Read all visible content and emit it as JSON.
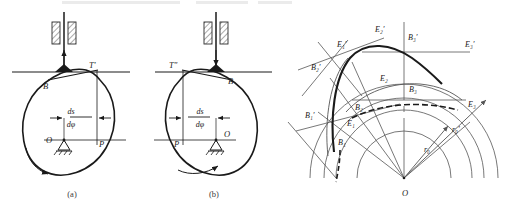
{
  "figure": {
    "background_color": "#ffffff",
    "ink_color": "#1a1a1a",
    "construction_line_color": "#6e6e6e",
    "panels": [
      {
        "id": "a",
        "caption": "(a)",
        "follower_tip_label": "T'",
        "contact_label": "B",
        "center_label": "O",
        "pitch_label": "P",
        "dimension_numerator": "ds",
        "dimension_denominator": "dφ",
        "rotation": "counterclockwise"
      },
      {
        "id": "b",
        "caption": "(b)",
        "follower_tip_label": "T″",
        "contact_label": "B",
        "center_label": "O",
        "pitch_label": "P",
        "dimension_numerator": "ds",
        "dimension_denominator": "dφ",
        "rotation": "clockwise"
      }
    ],
    "panel_c": {
      "center_label": "O",
      "base_radius_label": "r₀",
      "base_radius_prime_label": "r₀′",
      "points": [
        {
          "label": "B₁",
          "x": 338,
          "y": 145
        },
        {
          "label": "B₂",
          "x": 355,
          "y": 110
        },
        {
          "label": "B₃",
          "x": 409,
          "y": 92
        },
        {
          "label": "E₁",
          "x": 347,
          "y": 126
        },
        {
          "label": "E₂",
          "x": 380,
          "y": 81
        },
        {
          "label": "E₃",
          "x": 468,
          "y": 107
        },
        {
          "label": "B₁′",
          "x": 305,
          "y": 118
        },
        {
          "label": "B₂′",
          "x": 311,
          "y": 70
        },
        {
          "label": "B₃′",
          "x": 408,
          "y": 40
        },
        {
          "label": "E₁′",
          "x": 337,
          "y": 47
        },
        {
          "label": "E₂′",
          "x": 375,
          "y": 32
        },
        {
          "label": "E₃′",
          "x": 465,
          "y": 47
        }
      ]
    }
  }
}
